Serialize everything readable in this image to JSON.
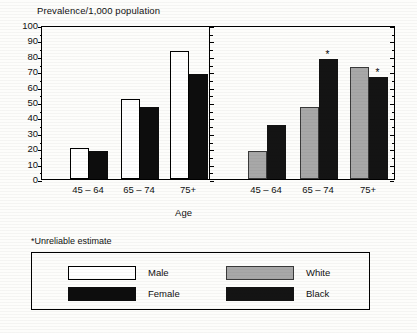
{
  "chart_data": {
    "type": "bar",
    "title": "",
    "ylabel": "Prevalence/1,000 population",
    "xlabel": "Age",
    "ylim": [
      0,
      100
    ],
    "ytick_labels": [
      "100",
      "90",
      "80",
      "70",
      "60",
      "50",
      "40",
      "30",
      "20",
      "10",
      "0"
    ],
    "ytick_values": [
      100,
      90,
      80,
      70,
      60,
      50,
      40,
      30,
      20,
      10,
      0
    ],
    "grid": false,
    "legend_position": "bottom",
    "categories": [
      "45 – 64",
      "65 – 74",
      "75+"
    ],
    "panels": [
      {
        "name": "sex",
        "categories": [
          "45 – 64",
          "65 – 74",
          "75+"
        ],
        "series": [
          {
            "name": "Male",
            "color": "#ffffff",
            "values": [
              20,
              52,
              83
            ],
            "flags": [
              false,
              false,
              false
            ]
          },
          {
            "name": "Female",
            "color": "#0d0d0d",
            "values": [
              18.5,
              47,
              68
            ],
            "flags": [
              false,
              false,
              false
            ]
          }
        ]
      },
      {
        "name": "race",
        "categories": [
          "45 – 64",
          "65 – 74",
          "75+"
        ],
        "series": [
          {
            "name": "White",
            "color": "#a8a8a8",
            "values": [
              18,
              46.5,
              73
            ],
            "flags": [
              false,
              false,
              false
            ]
          },
          {
            "name": "Black",
            "color": "#141414",
            "values": [
              35,
              78,
              66
            ],
            "flags": [
              false,
              true,
              true
            ]
          }
        ]
      }
    ],
    "annotations": [
      {
        "text": "*",
        "series": "Black",
        "category": "65 – 74",
        "meaning": "Unreliable estimate"
      },
      {
        "text": "*",
        "series": "Black",
        "category": "75+",
        "meaning": "Unreliable estimate"
      }
    ]
  },
  "footnote": {
    "text": "*Unreliable estimate"
  },
  "legend": {
    "entries": [
      {
        "label": "Male",
        "swatch": "white-outlined-swatch"
      },
      {
        "label": "Female",
        "swatch": "black-filled-swatch"
      },
      {
        "label": "White",
        "swatch": "gray-filled-swatch"
      },
      {
        "label": "Black",
        "swatch": "dark-filled-swatch"
      }
    ]
  },
  "axis": {
    "y_title": "Prevalence/1,000 population",
    "x_title": "Age"
  }
}
